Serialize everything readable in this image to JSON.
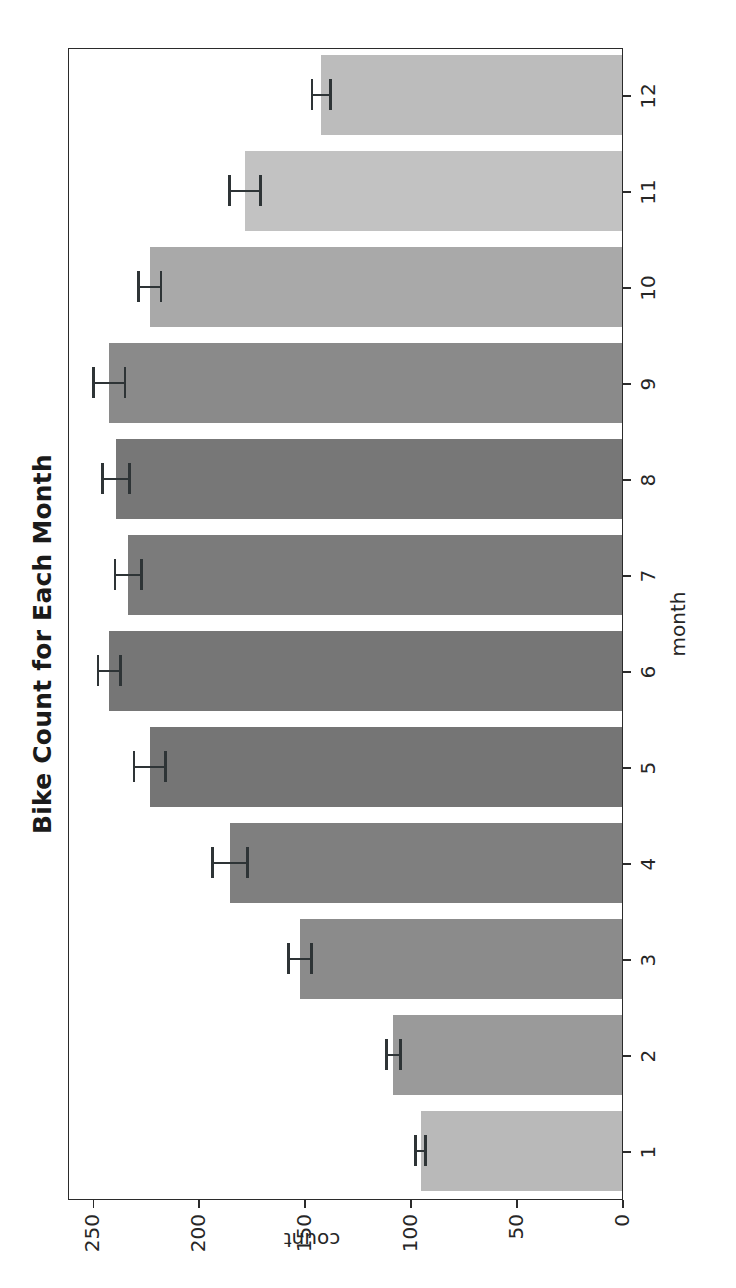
{
  "chart_data": {
    "type": "bar",
    "title": "Bike Count for Each Month",
    "xlabel": "month",
    "ylabel": "count",
    "orientation": "vertical",
    "grid": false,
    "legend": false,
    "categories": [
      "1",
      "2",
      "3",
      "4",
      "5",
      "6",
      "7",
      "8",
      "9",
      "10",
      "11",
      "12"
    ],
    "values": [
      95,
      108,
      152,
      185,
      223,
      242,
      233,
      239,
      242,
      223,
      178,
      142
    ],
    "errors": [
      3,
      4,
      6,
      9,
      8,
      6,
      7,
      7,
      8,
      6,
      8,
      5
    ],
    "xlim": [
      0.5,
      12.5
    ],
    "ylim": [
      0,
      262
    ],
    "yticks": [
      "0",
      "50",
      "100",
      "150",
      "200",
      "250"
    ],
    "ytick_values": [
      0,
      50,
      100,
      150,
      200,
      250
    ],
    "xticks": [
      "1",
      "2",
      "3",
      "4",
      "5",
      "6",
      "7",
      "8",
      "9",
      "10",
      "11",
      "12"
    ],
    "bar_colors": [
      "#b9b9b9",
      "#9a9a9a",
      "#8b8b8b",
      "#7f7f7f",
      "#757575",
      "#767676",
      "#7b7b7b",
      "#777777",
      "#8a8a8a",
      "#a9a9a9",
      "#c2c2c2",
      "#bcbcbc"
    ],
    "error_color": "#2e3436",
    "axis_color": "#2b2b2b",
    "background": "#ffffff"
  },
  "figure": {
    "rotation": "page rotated 90 degrees"
  }
}
